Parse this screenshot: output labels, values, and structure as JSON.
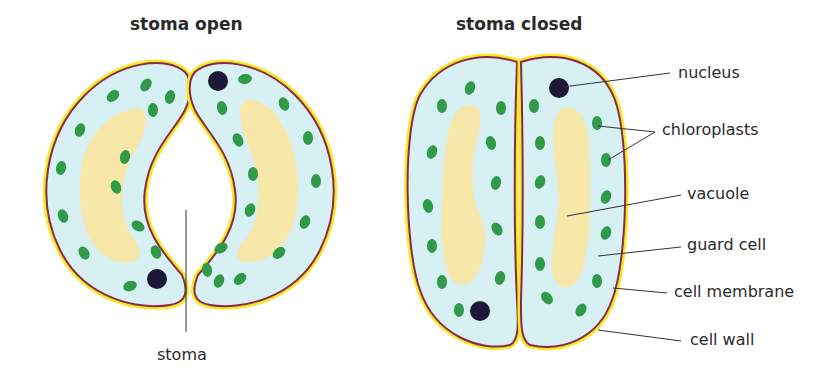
{
  "titles": {
    "open": "stoma open",
    "closed": "stoma closed"
  },
  "labels": {
    "stoma": "stoma",
    "nucleus": "nucleus",
    "chloroplasts": "chloroplasts",
    "vacuole": "vacuole",
    "guard_cell": "guard cell",
    "cell_membrane": "cell membrane",
    "cell_wall": "cell wall"
  },
  "colors": {
    "cell_wall": "#f5ea2a",
    "cell_membrane": "#8a2a4a",
    "cytoplasm": "#d6f0f3",
    "vacuole": "#f7e7a8",
    "chloroplast": "#2f9a48",
    "nucleus": "#1e1838",
    "leader_line": "#333333"
  }
}
